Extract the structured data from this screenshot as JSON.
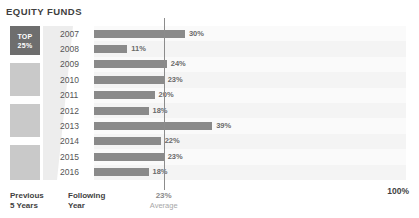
{
  "chart_data": {
    "type": "bar",
    "title": "EQUITY FUNDS",
    "orientation": "horizontal",
    "categories": [
      "2007",
      "2008",
      "2009",
      "2010",
      "2011",
      "2012",
      "2013",
      "2014",
      "2015",
      "2016"
    ],
    "values": [
      30,
      11,
      24,
      23,
      20,
      18,
      39,
      22,
      23,
      18
    ],
    "value_labels": [
      "30%",
      "11%",
      "24%",
      "23%",
      "20%",
      "18%",
      "39%",
      "22%",
      "23%",
      "18%"
    ],
    "xlabel": "",
    "ylabel": "",
    "xlim": [
      0,
      100
    ],
    "grid": false,
    "legend": "none",
    "annotations": [
      {
        "name": "average-line",
        "value": 23,
        "label": "23%",
        "caption": "Average"
      }
    ],
    "axis_max_label": "100%"
  },
  "header": {
    "title": "EQUITY FUNDS"
  },
  "quartiles": {
    "top_label_line1": "TOP",
    "top_label_line2": "25%",
    "blocks": [
      {
        "name": "top-quartile",
        "top": 26,
        "height": 29,
        "color": "#6e6e6e",
        "highlighted": true
      },
      {
        "name": "second-quartile",
        "top": 63,
        "height": 33,
        "color": "#c9c9c9",
        "highlighted": false
      },
      {
        "name": "third-quartile",
        "top": 104,
        "height": 33,
        "color": "#c9c9c9",
        "highlighted": false
      },
      {
        "name": "fourth-quartile",
        "top": 145,
        "height": 35,
        "color": "#c9c9c9",
        "highlighted": false
      }
    ]
  },
  "footer": {
    "previous_line1": "Previous",
    "previous_line2": "5 Years",
    "following_line1": "Following",
    "following_line2": "Year",
    "average_value": "23%",
    "average_caption": "Average",
    "scale_max": "100%"
  },
  "colors": {
    "bar": "#8a8a8a",
    "top_quartile": "#6e6e6e",
    "quartile": "#c9c9c9",
    "average_line": "#8c8c8c",
    "text": "#3f3f3f",
    "muted_text": "#a8a8a8"
  }
}
